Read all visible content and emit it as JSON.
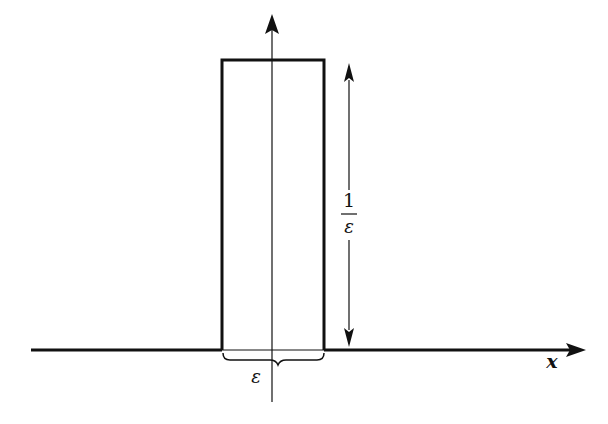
{
  "diagram": {
    "x_axis_label": "x",
    "height_label_numerator": "1",
    "height_label_denominator": "ε",
    "width_label": "ε",
    "colors": {
      "stroke": "#111111",
      "background": "#ffffff"
    },
    "geometry": {
      "axis_y": 350,
      "axis_x_start": 31,
      "axis_x_end": 584,
      "vertical_axis_x": 272,
      "vertical_axis_top": 14,
      "vertical_axis_bottom": 402,
      "pulse_left": 222,
      "pulse_right": 324,
      "pulse_top": 60,
      "dim_arrow_x": 349,
      "dim_arrow_top": 63,
      "dim_arrow_bottom": 347
    }
  }
}
